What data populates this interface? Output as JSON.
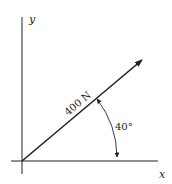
{
  "diagram": {
    "axes": {
      "x_label": "x",
      "y_label": "y"
    },
    "force": {
      "label": "400 N",
      "magnitude": 400,
      "unit": "N",
      "angle_deg": 40
    },
    "angle": {
      "label": "40°"
    },
    "colors": {
      "line": "#222222",
      "background": "#ffffff"
    }
  }
}
